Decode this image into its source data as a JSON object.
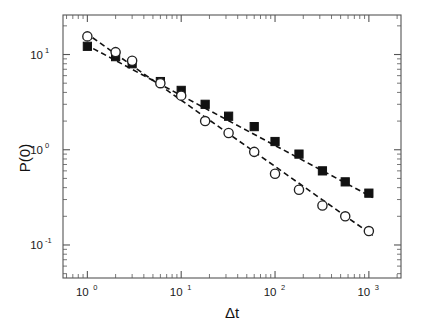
{
  "figure": {
    "background_color": "#ffffff",
    "frame_color": "#555555",
    "marker_color": "#111111",
    "fit_line_color": "#111111"
  },
  "axes": {
    "x_title": "Δt",
    "y_title": "P(0)",
    "x_ticks": [
      {
        "mantissa": "10",
        "exponent": "0",
        "value": 1
      },
      {
        "mantissa": "10",
        "exponent": "1",
        "value": 10
      },
      {
        "mantissa": "10",
        "exponent": "2",
        "value": 100
      },
      {
        "mantissa": "10",
        "exponent": "3",
        "value": 1000
      }
    ],
    "y_ticks": [
      {
        "mantissa": "10",
        "exponent": "1",
        "value": 10
      },
      {
        "mantissa": "10",
        "exponent": "0",
        "value": 1
      },
      {
        "mantissa": "10",
        "exponent": "-1",
        "value": 0.1
      }
    ]
  },
  "chart_data": {
    "type": "scatter",
    "title": "",
    "xlabel": "Δt",
    "ylabel": "P(0)",
    "xscale": "log",
    "yscale": "log",
    "xlim": [
      0.55,
      2200
    ],
    "ylim": [
      0.045,
      26
    ],
    "grid": false,
    "legend": "none",
    "series": [
      {
        "name": "filled-squares",
        "marker": "square",
        "marker_style": "filled",
        "x": [
          1,
          2,
          3,
          6,
          10,
          18,
          32,
          60,
          100,
          180,
          320,
          560,
          1000
        ],
        "y": [
          12.2,
          9.5,
          8.0,
          5.2,
          4.2,
          3.0,
          2.25,
          1.75,
          1.22,
          0.9,
          0.6,
          0.46,
          0.35
        ],
        "fit": {
          "type": "power-law",
          "style": "dashed",
          "slope": -0.525,
          "intercept_log10": 1.095,
          "x_start": 0.95,
          "x_end": 1100
        }
      },
      {
        "name": "open-circles",
        "marker": "circle",
        "marker_style": "open",
        "x": [
          1,
          2,
          3,
          6,
          10,
          18,
          32,
          60,
          100,
          180,
          320,
          560,
          1000
        ],
        "y": [
          15.5,
          10.6,
          8.6,
          5.0,
          3.7,
          2.0,
          1.5,
          0.95,
          0.56,
          0.38,
          0.26,
          0.2,
          0.14
        ],
        "fit": {
          "type": "power-law",
          "style": "dashed",
          "slope": -0.695,
          "intercept_log10": 1.215,
          "x_start": 0.95,
          "x_end": 1100
        }
      }
    ]
  }
}
